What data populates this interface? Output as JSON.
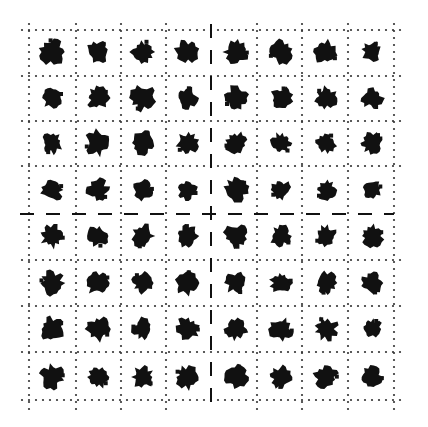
{
  "figure": {
    "rows": 8,
    "cols": 8,
    "ink_color": "#111111",
    "grid_color": "#333333",
    "background": "#ffffff",
    "v_lines": [
      29,
      76,
      121,
      166,
      257,
      302,
      348,
      394
    ],
    "h_lines": [
      30,
      76,
      121,
      166,
      260,
      306,
      352,
      400
    ],
    "divider_x": 211,
    "divider_y": 214,
    "col_centers": [
      52,
      98,
      143,
      187,
      236,
      281,
      326,
      372
    ],
    "row_centers": [
      52,
      98,
      143,
      190,
      236,
      283,
      329,
      377
    ],
    "blob_sizes": [
      [
        13,
        11,
        12,
        12,
        12,
        12,
        12,
        10
      ],
      [
        11,
        11,
        13,
        11,
        12,
        11,
        11,
        11
      ],
      [
        11,
        13,
        12,
        11,
        11,
        11,
        10,
        11
      ],
      [
        11,
        11,
        10,
        10,
        12,
        10,
        10,
        10
      ],
      [
        12,
        11,
        12,
        11,
        12,
        11,
        11,
        11
      ],
      [
        12,
        12,
        11,
        12,
        11,
        11,
        11,
        11
      ],
      [
        12,
        12,
        11,
        12,
        11,
        12,
        12,
        10
      ],
      [
        12,
        11,
        11,
        12,
        12,
        11,
        12,
        11
      ]
    ]
  }
}
